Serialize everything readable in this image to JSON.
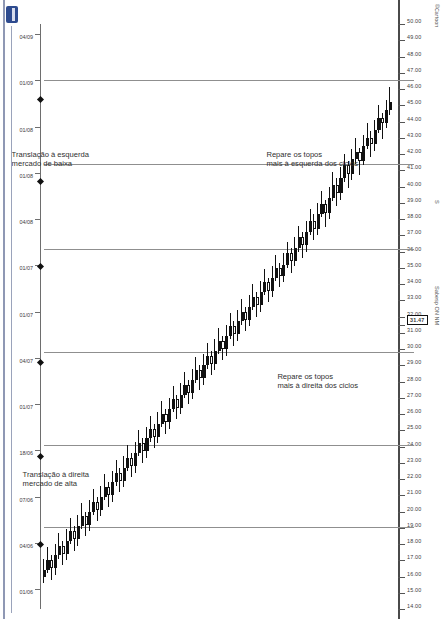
{
  "meta": {
    "ticker": "Sabesp ON NM",
    "corner_label": "©Cartoon",
    "scale_label": "S",
    "logo_name": "broker-logo"
  },
  "annotations": [
    {
      "id": "top-left-note",
      "text": "Repare os topos\nmais à esquerda dos ciclos"
    },
    {
      "id": "bottom-left-note",
      "text": "Repare os topos\nmais à direita dos ciclos"
    },
    {
      "id": "left-translation-note",
      "text": "Translação à esquerda\nmercado de baixa"
    },
    {
      "id": "right-translation-note",
      "text": "Translação à direita\nmercado de alta"
    }
  ],
  "chart_data": {
    "type": "candlestick",
    "title": "Sabesp ON NM",
    "orientation": "rotated-90",
    "xlabel": "",
    "ylabel": "",
    "grid": false,
    "legend": false,
    "highlighted_price": "31.47",
    "price_axis": {
      "min": 14.0,
      "max": 50.0,
      "ticks": [
        "50.00",
        "49.00",
        "48.00",
        "47.00",
        "46.00",
        "45.00",
        "44.00",
        "43.00",
        "42.00",
        "41.00",
        "40.00",
        "39.00",
        "38.00",
        "37.00",
        "36.00",
        "35.00",
        "34.00",
        "33.00",
        "32.00",
        "31.47",
        "31.00",
        "30.00",
        "29.00",
        "28.00",
        "27.00",
        "26.00",
        "25.00",
        "24.00",
        "23.00",
        "22.00",
        "21.00",
        "20.00",
        "19.00",
        "18.00",
        "17.00",
        "16.00",
        "15.00",
        "14.00"
      ]
    },
    "date_axis": {
      "ticks": [
        "04/09",
        "01/09",
        "01/08",
        "01/08",
        "04/08",
        "01/07",
        "01/07",
        "04/07",
        "01/07",
        "18/06",
        "07/06",
        "04/06",
        "01/06"
      ]
    },
    "cycle_separators_pct": [
      9.5,
      24.0,
      38.5,
      56.0,
      72.0,
      86.0
    ],
    "cycle_markers_pct": [
      12.5,
      26.5,
      41.0,
      57.5,
      73.5,
      88.5
    ],
    "series_name": "SBSP3",
    "candles": [
      {
        "o": 45.2,
        "h": 46.1,
        "l": 44.4,
        "c": 44.7,
        "d": 1
      },
      {
        "o": 44.7,
        "h": 45.3,
        "l": 43.6,
        "c": 43.9,
        "d": 1
      },
      {
        "o": 43.9,
        "h": 44.5,
        "l": 42.9,
        "c": 44.2,
        "d": 0
      },
      {
        "o": 44.2,
        "h": 45.0,
        "l": 43.3,
        "c": 43.5,
        "d": 1
      },
      {
        "o": 43.5,
        "h": 44.1,
        "l": 42.2,
        "c": 42.6,
        "d": 1
      },
      {
        "o": 42.6,
        "h": 43.4,
        "l": 41.8,
        "c": 43.0,
        "d": 0
      },
      {
        "o": 43.0,
        "h": 43.9,
        "l": 42.3,
        "c": 42.5,
        "d": 1
      },
      {
        "o": 42.5,
        "h": 43.2,
        "l": 41.3,
        "c": 41.6,
        "d": 1
      },
      {
        "o": 41.6,
        "h": 42.4,
        "l": 40.7,
        "c": 42.1,
        "d": 0
      },
      {
        "o": 42.1,
        "h": 43.0,
        "l": 41.4,
        "c": 41.7,
        "d": 1
      },
      {
        "o": 41.7,
        "h": 42.3,
        "l": 40.4,
        "c": 40.8,
        "d": 1
      },
      {
        "o": 40.8,
        "h": 41.6,
        "l": 39.9,
        "c": 41.3,
        "d": 0
      },
      {
        "o": 41.3,
        "h": 42.0,
        "l": 40.3,
        "c": 40.5,
        "d": 1
      },
      {
        "o": 40.5,
        "h": 41.2,
        "l": 39.2,
        "c": 39.6,
        "d": 1
      },
      {
        "o": 39.6,
        "h": 40.5,
        "l": 38.8,
        "c": 40.1,
        "d": 0
      },
      {
        "o": 40.1,
        "h": 40.9,
        "l": 39.1,
        "c": 39.3,
        "d": 1
      },
      {
        "o": 39.3,
        "h": 40.0,
        "l": 38.0,
        "c": 38.4,
        "d": 1
      },
      {
        "o": 38.4,
        "h": 39.2,
        "l": 37.5,
        "c": 38.9,
        "d": 0
      },
      {
        "o": 38.9,
        "h": 39.7,
        "l": 38.1,
        "c": 38.3,
        "d": 1
      },
      {
        "o": 38.3,
        "h": 39.0,
        "l": 37.0,
        "c": 37.4,
        "d": 1
      },
      {
        "o": 37.4,
        "h": 38.3,
        "l": 36.7,
        "c": 37.9,
        "d": 0
      },
      {
        "o": 37.9,
        "h": 38.6,
        "l": 37.0,
        "c": 37.2,
        "d": 1
      },
      {
        "o": 37.2,
        "h": 37.9,
        "l": 36.0,
        "c": 36.4,
        "d": 1
      },
      {
        "o": 36.4,
        "h": 37.2,
        "l": 35.6,
        "c": 36.9,
        "d": 0
      },
      {
        "o": 36.9,
        "h": 37.6,
        "l": 36.0,
        "c": 36.2,
        "d": 1
      },
      {
        "o": 36.2,
        "h": 36.9,
        "l": 35.1,
        "c": 35.4,
        "d": 1
      },
      {
        "o": 35.4,
        "h": 36.2,
        "l": 34.7,
        "c": 35.9,
        "d": 0
      },
      {
        "o": 35.9,
        "h": 36.6,
        "l": 35.0,
        "c": 35.2,
        "d": 1
      },
      {
        "o": 35.2,
        "h": 35.9,
        "l": 34.1,
        "c": 34.5,
        "d": 1
      },
      {
        "o": 34.5,
        "h": 35.3,
        "l": 33.8,
        "c": 35.0,
        "d": 0
      },
      {
        "o": 35.0,
        "h": 35.8,
        "l": 34.2,
        "c": 34.4,
        "d": 1
      },
      {
        "o": 34.4,
        "h": 35.1,
        "l": 33.2,
        "c": 33.6,
        "d": 1
      },
      {
        "o": 33.6,
        "h": 34.4,
        "l": 32.9,
        "c": 34.1,
        "d": 0
      },
      {
        "o": 34.1,
        "h": 34.9,
        "l": 33.3,
        "c": 33.5,
        "d": 1
      },
      {
        "o": 33.5,
        "h": 34.2,
        "l": 32.3,
        "c": 32.7,
        "d": 1
      },
      {
        "o": 32.7,
        "h": 33.5,
        "l": 32.0,
        "c": 33.2,
        "d": 0
      },
      {
        "o": 33.2,
        "h": 34.0,
        "l": 32.4,
        "c": 32.6,
        "d": 1
      },
      {
        "o": 32.6,
        "h": 33.3,
        "l": 31.4,
        "c": 31.8,
        "d": 1
      },
      {
        "o": 31.8,
        "h": 32.6,
        "l": 31.1,
        "c": 32.3,
        "d": 0
      },
      {
        "o": 32.3,
        "h": 33.1,
        "l": 31.5,
        "c": 31.7,
        "d": 1
      },
      {
        "o": 31.7,
        "h": 32.4,
        "l": 30.5,
        "c": 30.9,
        "d": 1
      },
      {
        "o": 30.9,
        "h": 31.7,
        "l": 30.2,
        "c": 31.4,
        "d": 0
      },
      {
        "o": 31.4,
        "h": 32.2,
        "l": 30.6,
        "c": 30.8,
        "d": 1
      },
      {
        "o": 30.8,
        "h": 31.5,
        "l": 29.6,
        "c": 30.0,
        "d": 1
      },
      {
        "o": 30.0,
        "h": 30.8,
        "l": 29.3,
        "c": 30.5,
        "d": 0
      },
      {
        "o": 30.5,
        "h": 31.3,
        "l": 29.7,
        "c": 29.9,
        "d": 1
      },
      {
        "o": 29.9,
        "h": 30.6,
        "l": 28.7,
        "c": 29.1,
        "d": 1
      },
      {
        "o": 29.1,
        "h": 29.9,
        "l": 28.4,
        "c": 29.6,
        "d": 0
      },
      {
        "o": 29.6,
        "h": 30.4,
        "l": 28.8,
        "c": 29.0,
        "d": 1
      },
      {
        "o": 29.0,
        "h": 29.7,
        "l": 27.8,
        "c": 28.2,
        "d": 1
      },
      {
        "o": 28.2,
        "h": 29.0,
        "l": 27.5,
        "c": 28.7,
        "d": 0
      },
      {
        "o": 28.7,
        "h": 29.5,
        "l": 27.9,
        "c": 28.1,
        "d": 1
      },
      {
        "o": 28.1,
        "h": 28.8,
        "l": 26.9,
        "c": 27.3,
        "d": 1
      },
      {
        "o": 27.3,
        "h": 28.1,
        "l": 26.6,
        "c": 27.8,
        "d": 0
      },
      {
        "o": 27.8,
        "h": 28.6,
        "l": 27.0,
        "c": 27.2,
        "d": 1
      },
      {
        "o": 27.2,
        "h": 27.9,
        "l": 26.0,
        "c": 26.4,
        "d": 1
      },
      {
        "o": 26.4,
        "h": 27.2,
        "l": 25.7,
        "c": 26.9,
        "d": 0
      },
      {
        "o": 26.9,
        "h": 27.7,
        "l": 26.1,
        "c": 26.3,
        "d": 1
      },
      {
        "o": 26.3,
        "h": 27.0,
        "l": 25.1,
        "c": 25.5,
        "d": 1
      },
      {
        "o": 25.5,
        "h": 26.3,
        "l": 24.8,
        "c": 26.0,
        "d": 0
      },
      {
        "o": 26.0,
        "h": 26.8,
        "l": 25.2,
        "c": 25.4,
        "d": 1
      },
      {
        "o": 25.4,
        "h": 26.1,
        "l": 24.2,
        "c": 24.6,
        "d": 1
      },
      {
        "o": 24.6,
        "h": 25.4,
        "l": 23.9,
        "c": 25.1,
        "d": 0
      },
      {
        "o": 25.1,
        "h": 25.9,
        "l": 24.3,
        "c": 24.5,
        "d": 1
      },
      {
        "o": 24.5,
        "h": 25.2,
        "l": 23.3,
        "c": 23.7,
        "d": 1
      },
      {
        "o": 23.7,
        "h": 24.5,
        "l": 23.0,
        "c": 24.2,
        "d": 0
      },
      {
        "o": 24.2,
        "h": 25.0,
        "l": 23.4,
        "c": 23.6,
        "d": 1
      },
      {
        "o": 23.6,
        "h": 24.3,
        "l": 22.4,
        "c": 22.8,
        "d": 1
      },
      {
        "o": 22.8,
        "h": 23.6,
        "l": 22.1,
        "c": 23.3,
        "d": 0
      },
      {
        "o": 23.3,
        "h": 24.1,
        "l": 22.5,
        "c": 22.7,
        "d": 1
      },
      {
        "o": 22.7,
        "h": 23.4,
        "l": 21.5,
        "c": 21.9,
        "d": 1
      },
      {
        "o": 21.9,
        "h": 22.7,
        "l": 21.2,
        "c": 22.4,
        "d": 0
      },
      {
        "o": 22.4,
        "h": 23.2,
        "l": 21.6,
        "c": 21.8,
        "d": 1
      },
      {
        "o": 21.8,
        "h": 22.5,
        "l": 20.6,
        "c": 21.0,
        "d": 1
      },
      {
        "o": 21.0,
        "h": 21.8,
        "l": 20.3,
        "c": 21.5,
        "d": 0
      },
      {
        "o": 21.5,
        "h": 22.3,
        "l": 20.7,
        "c": 20.9,
        "d": 1
      },
      {
        "o": 20.9,
        "h": 21.6,
        "l": 19.7,
        "c": 20.1,
        "d": 1
      },
      {
        "o": 20.1,
        "h": 20.9,
        "l": 19.4,
        "c": 20.6,
        "d": 0
      },
      {
        "o": 20.6,
        "h": 21.4,
        "l": 19.8,
        "c": 20.0,
        "d": 1
      },
      {
        "o": 20.0,
        "h": 20.7,
        "l": 18.8,
        "c": 19.2,
        "d": 1
      },
      {
        "o": 19.2,
        "h": 20.0,
        "l": 18.5,
        "c": 19.7,
        "d": 0
      },
      {
        "o": 19.7,
        "h": 20.5,
        "l": 18.9,
        "c": 19.1,
        "d": 1
      },
      {
        "o": 19.1,
        "h": 19.8,
        "l": 17.9,
        "c": 18.3,
        "d": 1
      },
      {
        "o": 18.3,
        "h": 19.1,
        "l": 17.6,
        "c": 18.8,
        "d": 0
      },
      {
        "o": 18.8,
        "h": 19.6,
        "l": 18.0,
        "c": 18.2,
        "d": 1
      },
      {
        "o": 18.2,
        "h": 18.9,
        "l": 17.0,
        "c": 17.4,
        "d": 1
      },
      {
        "o": 17.4,
        "h": 18.2,
        "l": 16.7,
        "c": 17.9,
        "d": 0
      },
      {
        "o": 17.9,
        "h": 18.7,
        "l": 17.1,
        "c": 17.3,
        "d": 1
      },
      {
        "o": 17.3,
        "h": 18.0,
        "l": 16.1,
        "c": 16.5,
        "d": 1
      },
      {
        "o": 16.5,
        "h": 17.3,
        "l": 15.8,
        "c": 17.0,
        "d": 0
      },
      {
        "o": 17.0,
        "h": 17.8,
        "l": 16.2,
        "c": 16.4,
        "d": 1
      },
      {
        "o": 16.4,
        "h": 17.1,
        "l": 15.6,
        "c": 16.0,
        "d": 1
      }
    ]
  }
}
